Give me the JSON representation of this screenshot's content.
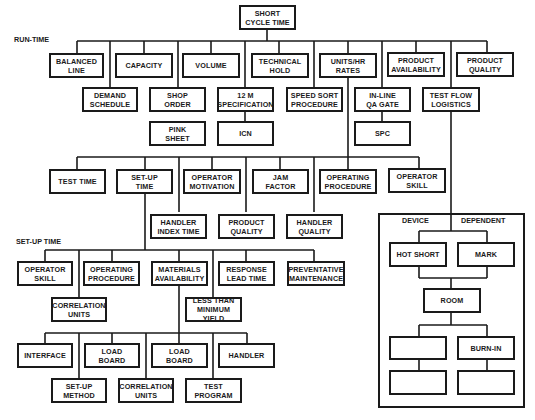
{
  "section_labels": {
    "run_time": "RUN-TIME",
    "set_up_time": "SET-UP TIME"
  },
  "root": "SHORT\nCYCLE TIME",
  "run_time": {
    "level1_top": [
      {
        "id": "balanced_line",
        "label": "BALANCED\nLINE"
      },
      {
        "id": "capacity",
        "label": "CAPACITY"
      },
      {
        "id": "volume",
        "label": "VOLUME"
      },
      {
        "id": "technical_hold",
        "label": "TECHNICAL\nHOLD"
      },
      {
        "id": "units_hr_rates",
        "label": "UNITS/HR\nRATES"
      },
      {
        "id": "product_availability",
        "label": "PRODUCT\nAVAILABILITY"
      },
      {
        "id": "product_quality",
        "label": "PRODUCT\nQUALITY"
      }
    ],
    "level1_bottom": [
      {
        "id": "demand_schedule",
        "label": "DEMAND\nSCHEDULE"
      },
      {
        "id": "shop_order",
        "label": "SHOP\nORDER"
      },
      {
        "id": "spec_12m",
        "label": "12 M\nSPECIFICATION"
      },
      {
        "id": "speed_sort",
        "label": "SPEED SORT\nPROCEDURE"
      },
      {
        "id": "inline_qa",
        "label": "IN-LINE\nQA GATE"
      },
      {
        "id": "test_flow",
        "label": "TEST FLOW\nLOGISTICS"
      }
    ],
    "level2": [
      {
        "id": "pink_sheet",
        "label": "PINK\nSHEET"
      },
      {
        "id": "icn",
        "label": "ICN"
      },
      {
        "id": "spc",
        "label": "SPC"
      }
    ]
  },
  "units_hr_children": {
    "top": [
      {
        "id": "test_time",
        "label": "TEST TIME"
      },
      {
        "id": "setup_time",
        "label": "SET-UP\nTIME"
      },
      {
        "id": "operator_motivation",
        "label": "OPERATOR\nMOTIVATION"
      },
      {
        "id": "jam_factor",
        "label": "JAM\nFACTOR"
      },
      {
        "id": "operating_procedure",
        "label": "OPERATING\nPROCEDURE"
      },
      {
        "id": "operator_skill",
        "label": "OPERATOR\nSKILL"
      }
    ],
    "bottom": [
      {
        "id": "handler_index_time",
        "label": "HANDLER\nINDEX TIME"
      },
      {
        "id": "product_quality_2",
        "label": "PRODUCT\nQUALITY"
      },
      {
        "id": "handler_quality",
        "label": "HANDLER\nQUALITY"
      }
    ]
  },
  "set_up_time": {
    "top": [
      {
        "id": "su_operator_skill",
        "label": "OPERATOR\nSKILL"
      },
      {
        "id": "su_operating_procedure",
        "label": "OPERATING\nPROCEDURE"
      },
      {
        "id": "materials_availability",
        "label": "MATERIALS\nAVAILABILITY"
      },
      {
        "id": "response_lead_time",
        "label": "RESPONSE\nLEAD TIME"
      },
      {
        "id": "preventative_maintenance",
        "label": "PREVENTATIVE\nMAINTENANCE"
      }
    ],
    "bottom": [
      {
        "id": "su_correlation_units",
        "label": "CORRELATION\nUNITS"
      },
      {
        "id": "less_than_min_yield",
        "label": "LESS THAN\nMINIMUM YIELD"
      }
    ]
  },
  "materials_children": {
    "top": [
      {
        "id": "interface",
        "label": "INTERFACE"
      },
      {
        "id": "load_board_1",
        "label": "LOAD\nBOARD"
      },
      {
        "id": "load_board_2",
        "label": "LOAD\nBOARD"
      },
      {
        "id": "handler",
        "label": "HANDLER"
      }
    ],
    "bottom": [
      {
        "id": "setup_method",
        "label": "SET-UP\nMETHOD"
      },
      {
        "id": "mat_correlation_units",
        "label": "CORRELATION\nUNITS"
      },
      {
        "id": "test_program",
        "label": "TEST\nPROGRAM"
      }
    ]
  },
  "device_dependent": {
    "header_left": "DEVICE",
    "header_right": "DEPENDENT",
    "hot_short": "HOT SHORT",
    "mark": "MARK",
    "room": "ROOM",
    "blank_left_1": "",
    "burn_in": "BURN-IN",
    "blank_left_2": "",
    "blank_right_2": ""
  }
}
